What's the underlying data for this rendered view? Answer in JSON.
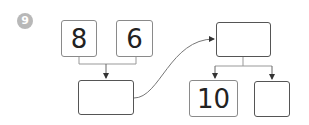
{
  "question_number": "9",
  "boxes": {
    "top_left_1": "8",
    "top_left_2": "6",
    "middle_left_result": "",
    "top_right": "",
    "bottom_right_1": "10",
    "bottom_right_2": ""
  },
  "colors": {
    "badge": "#b8b8b8",
    "line": "#888888"
  }
}
